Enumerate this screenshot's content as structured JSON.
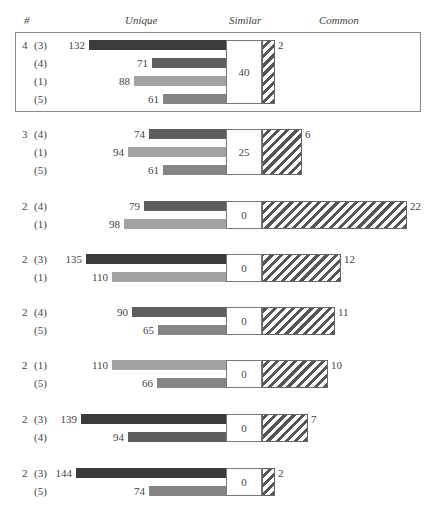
{
  "header": {
    "col_count": "#",
    "col_unique": "Unique",
    "col_similar": "Similar",
    "col_common": "Common"
  },
  "colors": {
    "(3)": "#3b3b3b",
    "(4)": "#5e5e5e",
    "(1)": "#a3a3a3",
    "(5)": "#858585",
    "hatch": "#555555"
  },
  "chart_data": {
    "type": "bar",
    "title": "",
    "columns": [
      "#",
      "Unique",
      "Similar",
      "Common"
    ],
    "groups": [
      {
        "count": "4",
        "boxed": true,
        "similar": 40,
        "common": 2,
        "rows": [
          {
            "id": "(3)",
            "unique": 132
          },
          {
            "id": "(4)",
            "unique": 71
          },
          {
            "id": "(1)",
            "unique": 88
          },
          {
            "id": "(5)",
            "unique": 61
          }
        ]
      },
      {
        "count": "3",
        "boxed": false,
        "similar": 25,
        "common": 6,
        "rows": [
          {
            "id": "(4)",
            "unique": 74
          },
          {
            "id": "(1)",
            "unique": 94
          },
          {
            "id": "(5)",
            "unique": 61
          }
        ]
      },
      {
        "count": "2",
        "boxed": false,
        "similar": 0,
        "common": 22,
        "rows": [
          {
            "id": "(4)",
            "unique": 79
          },
          {
            "id": "(1)",
            "unique": 98
          }
        ]
      },
      {
        "count": "2",
        "boxed": false,
        "similar": 0,
        "common": 12,
        "rows": [
          {
            "id": "(3)",
            "unique": 135
          },
          {
            "id": "(1)",
            "unique": 110
          }
        ]
      },
      {
        "count": "2",
        "boxed": false,
        "similar": 0,
        "common": 11,
        "rows": [
          {
            "id": "(4)",
            "unique": 90
          },
          {
            "id": "(5)",
            "unique": 65
          }
        ]
      },
      {
        "count": "2",
        "boxed": false,
        "similar": 0,
        "common": 10,
        "rows": [
          {
            "id": "(1)",
            "unique": 110
          },
          {
            "id": "(5)",
            "unique": 66
          }
        ]
      },
      {
        "count": "2",
        "boxed": false,
        "similar": 0,
        "common": 7,
        "rows": [
          {
            "id": "(3)",
            "unique": 139
          },
          {
            "id": "(4)",
            "unique": 94
          }
        ]
      },
      {
        "count": "2",
        "boxed": false,
        "similar": 0,
        "common": 2,
        "rows": [
          {
            "id": "(3)",
            "unique": 144
          },
          {
            "id": "(5)",
            "unique": 74
          }
        ]
      }
    ],
    "legend": {
      "(3)": "darkest gray",
      "(4)": "dark gray",
      "(5)": "medium gray",
      "(1)": "light gray",
      "Common": "diagonal hatch"
    },
    "grid": false
  }
}
